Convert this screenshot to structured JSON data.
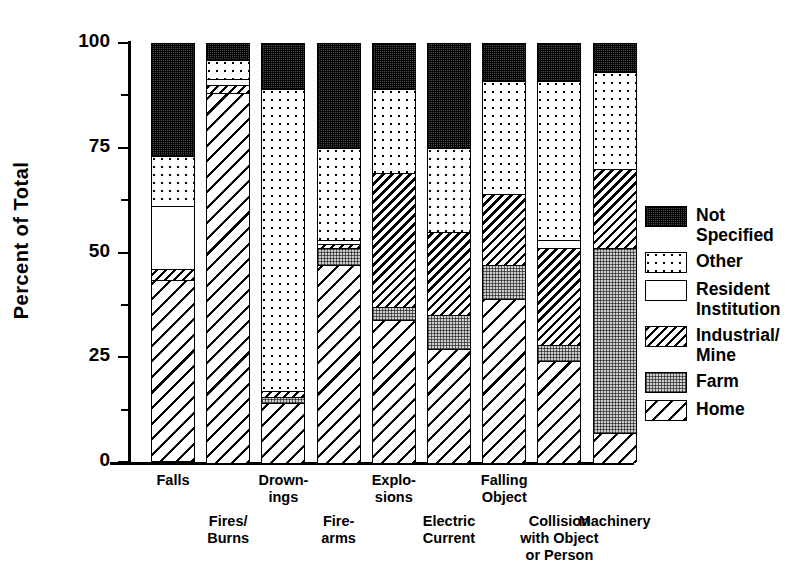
{
  "chart_data": {
    "type": "bar",
    "subtype": "stacked-100-percent",
    "title": "",
    "xlabel": "",
    "ylabel": "Percent of Total",
    "ylim": [
      0,
      100
    ],
    "yticks": [
      0,
      25,
      50,
      75,
      100
    ],
    "ytick_labels": [
      "0",
      "25",
      "50",
      "75",
      "100"
    ],
    "minor_yticks": [
      12.5,
      37.5,
      62.5,
      87.5
    ],
    "grid": false,
    "legend_position": "right",
    "categories": [
      "Falls",
      "Fires/\nBurns",
      "Drown-\nings",
      "Fire-\narms",
      "Explo-\nsions",
      "Electric\nCurrent",
      "Falling\nObject",
      "Collision\nwith Object\nor Person",
      "Machinery"
    ],
    "series": [
      {
        "name": "Home",
        "pattern": "home",
        "values": [
          43,
          88,
          14,
          47,
          34,
          27,
          39,
          24,
          7
        ]
      },
      {
        "name": "Farm",
        "pattern": "farm",
        "values": [
          0,
          0,
          1.5,
          4,
          3,
          8,
          8,
          4,
          44
        ]
      },
      {
        "name": "Industrial/\nMine",
        "pattern": "industrial",
        "values": [
          2.5,
          2,
          1.5,
          1,
          32,
          20,
          17,
          23,
          19
        ]
      },
      {
        "name": "Resident\nInstitution",
        "pattern": "resident",
        "values": [
          15,
          1.5,
          0,
          1,
          0,
          0,
          0,
          2,
          0
        ]
      },
      {
        "name": "Other",
        "pattern": "other",
        "values": [
          12,
          4.5,
          72,
          22,
          20,
          20,
          27,
          38,
          23
        ]
      },
      {
        "name": "Not\nSpecified",
        "pattern": "notspec",
        "values": [
          27,
          4,
          11,
          25,
          11,
          25,
          9,
          9,
          7
        ]
      }
    ],
    "legend_entries": [
      {
        "label": "Not\nSpecified",
        "pattern": "notspec"
      },
      {
        "label": "Other",
        "pattern": "other"
      },
      {
        "label": "Resident\nInstitution",
        "pattern": "resident"
      },
      {
        "label": "Industrial/\nMine",
        "pattern": "industrial"
      },
      {
        "label": "Farm",
        "pattern": "farm"
      },
      {
        "label": "Home",
        "pattern": "home"
      }
    ]
  },
  "axis": {
    "y_title": "Percent of Total"
  },
  "layout": {
    "x_label_rows": [
      0,
      1,
      0,
      1,
      0,
      1,
      0,
      1,
      1
    ]
  }
}
